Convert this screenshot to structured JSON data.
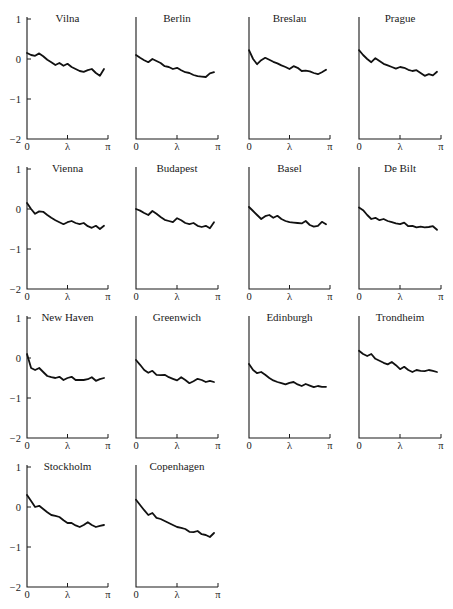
{
  "figure": {
    "layout": {
      "rows": 4,
      "cols": 4
    },
    "y_tick_labels": [
      "1",
      "0",
      "−1",
      "−2"
    ],
    "x_tick_labels": [
      "0",
      "λ",
      "π"
    ]
  },
  "chart_data": [
    {
      "type": "line",
      "title": "Vilna",
      "xlabel": "",
      "ylabel": "",
      "xlim": [
        0,
        3.1416
      ],
      "ylim": [
        -2,
        1
      ],
      "x_ticks": [
        "0",
        "λ",
        "π"
      ],
      "y_ticks": [
        1,
        0,
        -1,
        -2
      ],
      "show_y_labels": true,
      "values": [
        0.15,
        0.1,
        0.08,
        0.14,
        0.07,
        -0.02,
        -0.08,
        -0.15,
        -0.1,
        -0.17,
        -0.12,
        -0.2,
        -0.25,
        -0.3,
        -0.32,
        -0.28,
        -0.25,
        -0.35,
        -0.42,
        -0.25
      ]
    },
    {
      "type": "line",
      "title": "Berlin",
      "xlabel": "",
      "ylabel": "",
      "xlim": [
        0,
        3.1416
      ],
      "ylim": [
        -2,
        1
      ],
      "x_ticks": [
        "0",
        "λ",
        "π"
      ],
      "y_ticks": [
        1,
        0,
        -1,
        -2
      ],
      "show_y_labels": false,
      "values": [
        0.1,
        0.03,
        -0.03,
        -0.08,
        0.0,
        -0.05,
        -0.1,
        -0.18,
        -0.2,
        -0.25,
        -0.22,
        -0.28,
        -0.33,
        -0.35,
        -0.4,
        -0.43,
        -0.44,
        -0.45,
        -0.36,
        -0.33
      ]
    },
    {
      "type": "line",
      "title": "Breslau",
      "xlabel": "",
      "ylabel": "",
      "xlim": [
        0,
        3.1416
      ],
      "ylim": [
        -2,
        1
      ],
      "x_ticks": [
        "0",
        "λ",
        "π"
      ],
      "y_ticks": [
        1,
        0,
        -1,
        -2
      ],
      "show_y_labels": false,
      "values": [
        0.22,
        0.0,
        -0.13,
        -0.03,
        0.03,
        -0.02,
        -0.07,
        -0.11,
        -0.16,
        -0.2,
        -0.25,
        -0.18,
        -0.22,
        -0.3,
        -0.29,
        -0.31,
        -0.35,
        -0.38,
        -0.33,
        -0.27
      ]
    },
    {
      "type": "line",
      "title": "Prague",
      "xlabel": "",
      "ylabel": "",
      "xlim": [
        0,
        3.1416
      ],
      "ylim": [
        -2,
        1
      ],
      "x_ticks": [
        "0",
        "λ",
        "π"
      ],
      "y_ticks": [
        1,
        0,
        -1,
        -2
      ],
      "show_y_labels": false,
      "values": [
        0.22,
        0.1,
        0.0,
        -0.08,
        0.02,
        -0.05,
        -0.12,
        -0.16,
        -0.2,
        -0.24,
        -0.2,
        -0.22,
        -0.27,
        -0.3,
        -0.28,
        -0.35,
        -0.42,
        -0.38,
        -0.41,
        -0.32
      ]
    },
    {
      "type": "line",
      "title": "Vienna",
      "xlabel": "",
      "ylabel": "",
      "xlim": [
        0,
        3.1416
      ],
      "ylim": [
        -2,
        1
      ],
      "x_ticks": [
        "0",
        "λ",
        "π"
      ],
      "y_ticks": [
        1,
        0,
        -1,
        -2
      ],
      "show_y_labels": true,
      "values": [
        0.15,
        0.0,
        -0.12,
        -0.06,
        -0.07,
        -0.15,
        -0.22,
        -0.28,
        -0.33,
        -0.38,
        -0.33,
        -0.3,
        -0.35,
        -0.38,
        -0.35,
        -0.43,
        -0.47,
        -0.42,
        -0.5,
        -0.42
      ]
    },
    {
      "type": "line",
      "title": "Budapest",
      "xlabel": "",
      "ylabel": "",
      "xlim": [
        0,
        3.1416
      ],
      "ylim": [
        -2,
        1
      ],
      "x_ticks": [
        "0",
        "λ",
        "π"
      ],
      "y_ticks": [
        1,
        0,
        -1,
        -2
      ],
      "show_y_labels": false,
      "values": [
        0.0,
        -0.04,
        -0.1,
        -0.15,
        -0.05,
        -0.12,
        -0.2,
        -0.27,
        -0.3,
        -0.33,
        -0.23,
        -0.28,
        -0.35,
        -0.38,
        -0.35,
        -0.42,
        -0.45,
        -0.42,
        -0.48,
        -0.33
      ]
    },
    {
      "type": "line",
      "title": "Basel",
      "xlabel": "",
      "ylabel": "",
      "xlim": [
        0,
        3.1416
      ],
      "ylim": [
        -2,
        1
      ],
      "x_ticks": [
        "0",
        "λ",
        "π"
      ],
      "y_ticks": [
        1,
        0,
        -1,
        -2
      ],
      "show_y_labels": false,
      "values": [
        0.05,
        -0.05,
        -0.15,
        -0.25,
        -0.18,
        -0.15,
        -0.22,
        -0.17,
        -0.25,
        -0.3,
        -0.33,
        -0.34,
        -0.35,
        -0.36,
        -0.3,
        -0.4,
        -0.44,
        -0.42,
        -0.32,
        -0.38
      ]
    },
    {
      "type": "line",
      "title": "De Bilt",
      "xlabel": "",
      "ylabel": "",
      "xlim": [
        0,
        3.1416
      ],
      "ylim": [
        -2,
        1
      ],
      "x_ticks": [
        "0",
        "λ",
        "π"
      ],
      "y_ticks": [
        1,
        0,
        -1,
        -2
      ],
      "show_y_labels": false,
      "values": [
        0.04,
        -0.03,
        -0.15,
        -0.25,
        -0.22,
        -0.28,
        -0.25,
        -0.3,
        -0.33,
        -0.36,
        -0.38,
        -0.34,
        -0.43,
        -0.42,
        -0.46,
        -0.44,
        -0.46,
        -0.45,
        -0.43,
        -0.52
      ]
    },
    {
      "type": "line",
      "title": "New Haven",
      "xlabel": "",
      "ylabel": "",
      "xlim": [
        0,
        3.1416
      ],
      "ylim": [
        -2,
        1
      ],
      "x_ticks": [
        "0",
        "λ",
        "π"
      ],
      "y_ticks": [
        1,
        0,
        -1,
        -2
      ],
      "show_y_labels": true,
      "values": [
        0.1,
        -0.25,
        -0.3,
        -0.25,
        -0.35,
        -0.45,
        -0.48,
        -0.5,
        -0.47,
        -0.55,
        -0.5,
        -0.47,
        -0.55,
        -0.55,
        -0.55,
        -0.53,
        -0.48,
        -0.57,
        -0.53,
        -0.5
      ]
    },
    {
      "type": "line",
      "title": "Greenwich",
      "xlabel": "",
      "ylabel": "",
      "xlim": [
        0,
        3.1416
      ],
      "ylim": [
        -2,
        1
      ],
      "x_ticks": [
        "0",
        "λ",
        "π"
      ],
      "y_ticks": [
        1,
        0,
        -1,
        -2
      ],
      "show_y_labels": false,
      "values": [
        -0.05,
        -0.17,
        -0.3,
        -0.37,
        -0.32,
        -0.42,
        -0.43,
        -0.42,
        -0.48,
        -0.52,
        -0.56,
        -0.48,
        -0.55,
        -0.63,
        -0.58,
        -0.52,
        -0.55,
        -0.6,
        -0.57,
        -0.6
      ]
    },
    {
      "type": "line",
      "title": "Edinburgh",
      "xlabel": "",
      "ylabel": "",
      "xlim": [
        0,
        3.1416
      ],
      "ylim": [
        -2,
        1
      ],
      "x_ticks": [
        "0",
        "λ",
        "π"
      ],
      "y_ticks": [
        1,
        0,
        -1,
        -2
      ],
      "show_y_labels": false,
      "values": [
        -0.15,
        -0.3,
        -0.38,
        -0.35,
        -0.42,
        -0.5,
        -0.56,
        -0.6,
        -0.63,
        -0.66,
        -0.62,
        -0.6,
        -0.66,
        -0.7,
        -0.65,
        -0.69,
        -0.73,
        -0.7,
        -0.72,
        -0.72
      ]
    },
    {
      "type": "line",
      "title": "Trondheim",
      "xlabel": "",
      "ylabel": "",
      "xlim": [
        0,
        3.1416
      ],
      "ylim": [
        -2,
        1
      ],
      "x_ticks": [
        "0",
        "λ",
        "π"
      ],
      "y_ticks": [
        1,
        0,
        -1,
        -2
      ],
      "show_y_labels": false,
      "values": [
        0.18,
        0.1,
        0.05,
        0.1,
        -0.02,
        -0.07,
        -0.12,
        -0.16,
        -0.1,
        -0.18,
        -0.28,
        -0.22,
        -0.3,
        -0.35,
        -0.3,
        -0.32,
        -0.33,
        -0.3,
        -0.32,
        -0.35
      ]
    },
    {
      "type": "line",
      "title": "Stockholm",
      "xlabel": "",
      "ylabel": "",
      "xlim": [
        0,
        3.1416
      ],
      "ylim": [
        -2,
        1
      ],
      "x_ticks": [
        "0",
        "λ",
        "π"
      ],
      "y_ticks": [
        1,
        0,
        -1,
        -2
      ],
      "show_y_labels": true,
      "values": [
        0.3,
        0.15,
        0.0,
        0.03,
        -0.05,
        -0.13,
        -0.2,
        -0.22,
        -0.25,
        -0.33,
        -0.4,
        -0.4,
        -0.46,
        -0.5,
        -0.45,
        -0.38,
        -0.45,
        -0.5,
        -0.47,
        -0.45
      ]
    },
    {
      "type": "line",
      "title": "Copenhagen",
      "xlabel": "",
      "ylabel": "",
      "xlim": [
        0,
        3.1416
      ],
      "ylim": [
        -2,
        1
      ],
      "x_ticks": [
        "0",
        "λ",
        "π"
      ],
      "y_ticks": [
        1,
        0,
        -1,
        -2
      ],
      "show_y_labels": false,
      "values": [
        0.18,
        0.05,
        -0.08,
        -0.2,
        -0.15,
        -0.27,
        -0.3,
        -0.35,
        -0.4,
        -0.45,
        -0.5,
        -0.52,
        -0.55,
        -0.62,
        -0.63,
        -0.6,
        -0.68,
        -0.7,
        -0.75,
        -0.65
      ]
    }
  ]
}
